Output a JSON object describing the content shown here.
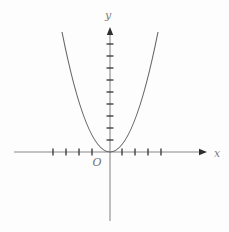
{
  "chart_data": {
    "type": "line",
    "title": "",
    "xlabel": "x",
    "ylabel": "y",
    "origin_label": "O",
    "x": [
      -3,
      -2,
      -1,
      0,
      1,
      2,
      3
    ],
    "series": [
      {
        "name": "parabola y = x^2",
        "values": [
          9,
          4,
          1,
          0,
          1,
          4,
          9
        ]
      }
    ],
    "grid": false,
    "legend": false,
    "x_tick_count": {
      "left_of_origin": 4,
      "right_of_origin": 4
    },
    "y_tick_count": 9,
    "layout_px": {
      "x_axis": {
        "y": 152,
        "x_start": 14,
        "x_end": 207
      },
      "y_axis": {
        "x": 110,
        "y_top": 27,
        "y_bottom": 221
      },
      "x_ticks": [
        53,
        66,
        79,
        92,
        122,
        135,
        148,
        161
      ],
      "y_ticks": [
        44,
        56,
        68,
        80,
        92,
        104,
        116,
        128,
        140
      ],
      "tick_half_length": 3.5,
      "arrow_length": 8,
      "arrow_half_width": 3.2,
      "curve": {
        "vertex": [
          110,
          152
        ],
        "top_y": 32,
        "half_width": 48
      }
    },
    "colors": {
      "background": "#fdfdfd",
      "axis": "#8a8a8a",
      "tick": "#333333",
      "arrow": "#2f2f2f",
      "curve": "#666666",
      "label": "#7d7d7d"
    }
  }
}
